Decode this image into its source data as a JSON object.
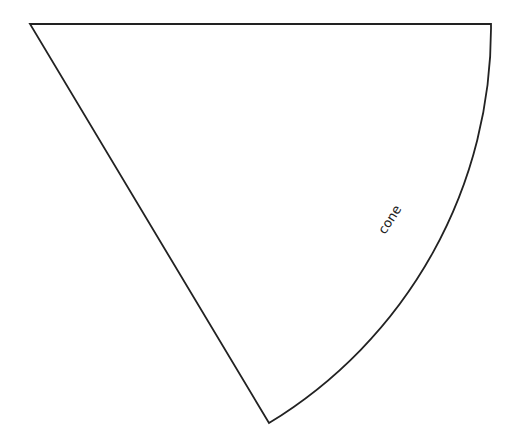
{
  "diagram": {
    "shape": "circular-sector",
    "label": "cone",
    "label_rotation_deg": -57,
    "stroke_color": "#222222",
    "background_color": "#ffffff",
    "points": {
      "apex": [
        30,
        24
      ],
      "arc_start": [
        491,
        24
      ],
      "arc_end": [
        269,
        423
      ]
    },
    "radius": 462
  }
}
